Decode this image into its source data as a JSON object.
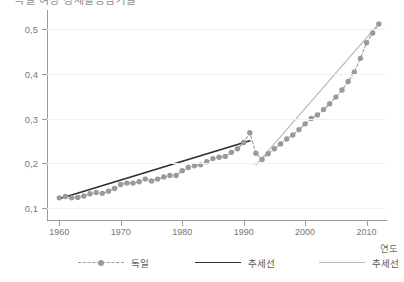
{
  "title": "독일 여성 경제활동참가율",
  "axis": {
    "xlabel": "연도",
    "ylabel": "",
    "xticks": [
      "1960",
      "1970",
      "1980",
      "1990",
      "2000",
      "2010"
    ],
    "yticks": [
      "0,1",
      "0,2",
      "0,3",
      "0,4",
      "0,5"
    ]
  },
  "legend": {
    "items": [
      {
        "label": "독일",
        "style": "dashed-marker",
        "color": "#9a9a9a"
      },
      {
        "label": "추세선",
        "style": "solid-dark",
        "color": "#2f2f2f"
      },
      {
        "label": "추세선",
        "style": "solid-light",
        "color": "#b9b9b9"
      }
    ]
  },
  "colors": {
    "marker": "#9a9a9a",
    "series_line": "#9a9a9a",
    "trend_dark": "#2f2f2f",
    "trend_light": "#b9b9b9",
    "grid": "#f0f0f0",
    "axis": "#9b9b9b",
    "text": "#777777",
    "background": "#ffffff"
  },
  "chart_data": {
    "type": "line",
    "title": "독일 여성 경제활동참가율",
    "xlabel": "연도",
    "ylabel": "",
    "xlim": [
      1958,
      2013
    ],
    "ylim": [
      0.07,
      0.53
    ],
    "grid": true,
    "legend_position": "bottom",
    "series": [
      {
        "name": "독일",
        "style": "dashed-marker",
        "color": "#9a9a9a",
        "x": [
          1960,
          1961,
          1962,
          1963,
          1964,
          1965,
          1966,
          1967,
          1968,
          1969,
          1970,
          1971,
          1972,
          1973,
          1974,
          1975,
          1976,
          1977,
          1978,
          1979,
          1980,
          1981,
          1982,
          1983,
          1984,
          1985,
          1986,
          1987,
          1988,
          1989,
          1990,
          1991,
          1992,
          1993,
          1994,
          1995,
          1996,
          1997,
          1998,
          1999,
          2000,
          2001,
          2002,
          2003,
          2004,
          2005,
          2006,
          2007,
          2008,
          2009,
          2010,
          2011,
          2012
        ],
        "y": [
          0.122,
          0.125,
          0.122,
          0.123,
          0.126,
          0.131,
          0.134,
          0.132,
          0.137,
          0.143,
          0.152,
          0.155,
          0.155,
          0.158,
          0.164,
          0.16,
          0.164,
          0.169,
          0.172,
          0.172,
          0.183,
          0.19,
          0.194,
          0.196,
          0.203,
          0.21,
          0.213,
          0.215,
          0.224,
          0.232,
          0.246,
          0.268,
          0.222,
          0.208,
          0.221,
          0.232,
          0.243,
          0.254,
          0.263,
          0.275,
          0.288,
          0.3,
          0.308,
          0.32,
          0.333,
          0.348,
          0.364,
          0.383,
          0.404,
          0.435,
          0.47,
          0.492,
          0.512
        ]
      },
      {
        "name": "추세선",
        "style": "solid-dark",
        "color": "#2f2f2f",
        "segment": "1960-1991",
        "x": [
          1960,
          1991
        ],
        "y": [
          0.12,
          0.25
        ]
      },
      {
        "name": "추세선",
        "style": "solid-light",
        "color": "#b9b9b9",
        "segment": "1992-2012",
        "x": [
          1992,
          2012
        ],
        "y": [
          0.196,
          0.513
        ]
      }
    ]
  }
}
